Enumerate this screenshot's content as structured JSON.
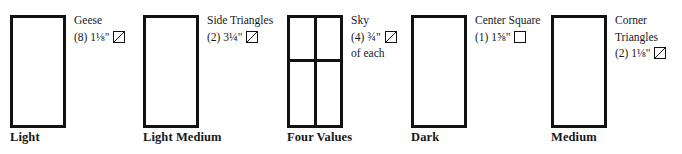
{
  "diagram": {
    "type": "fabric-value-chart",
    "groups": [
      {
        "value_label": "Light",
        "swatch": {
          "divided": false
        },
        "cut": {
          "name": "Geese",
          "quantity": "(8)",
          "size": "1⅛\"",
          "shape_icon": "triangle-icon",
          "note": ""
        }
      },
      {
        "value_label": "Light Medium",
        "swatch": {
          "divided": false
        },
        "cut": {
          "name": "Side Triangles",
          "quantity": "(2)",
          "size": "3¼\"",
          "shape_icon": "triangle-icon",
          "note": ""
        }
      },
      {
        "value_label": "Four Values",
        "swatch": {
          "divided": true
        },
        "cut": {
          "name": "Sky",
          "quantity": "(4)",
          "size": "¾\"",
          "shape_icon": "triangle-icon",
          "note": "of each"
        }
      },
      {
        "value_label": "Dark",
        "swatch": {
          "divided": false
        },
        "cut": {
          "name": "Center Square",
          "quantity": "(1)",
          "size": "1⅝\"",
          "shape_icon": "square-icon",
          "note": ""
        }
      },
      {
        "value_label": "Medium",
        "swatch": {
          "divided": false
        },
        "cut": {
          "name": "Corner Triangles",
          "name_line1": "Corner",
          "name_line2": "Triangles",
          "quantity": "(2)",
          "size": "1⅛\"",
          "shape_icon": "triangle-icon",
          "note": ""
        }
      }
    ]
  },
  "colors": {
    "ink": "#111214",
    "paper": "#ffffff"
  }
}
